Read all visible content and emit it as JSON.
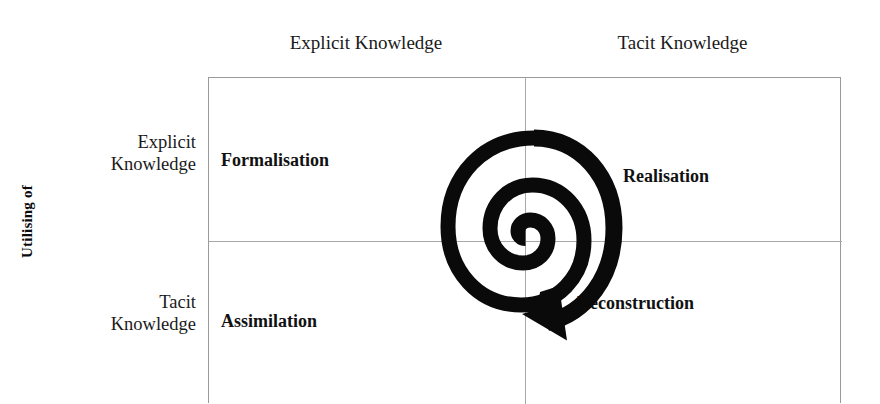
{
  "figure": {
    "type": "2x2-matrix-diagram",
    "columns_axis": {
      "labels": [
        "Explicit Knowledge",
        "Tacit Knowledge"
      ]
    },
    "rows_axis": {
      "title": "Utilising of",
      "labels": [
        {
          "line1": "Explicit",
          "line2": "Knowledge"
        },
        {
          "line1": "Tacit",
          "line2": "Knowledge"
        }
      ]
    },
    "quadrants": {
      "top_left": "Formalisation",
      "top_right": "Realisation",
      "bottom_left": "Assimilation",
      "bottom_right": "Deconstruction"
    },
    "center_graphic": {
      "name": "spiral-arrow",
      "color": "#000000",
      "direction": "outward-clockwise-with-arrowhead"
    },
    "colors": {
      "text": "#111111",
      "frame_line": "#9a9a9a",
      "divider_line": "#a8a8a8",
      "spiral": "#000000",
      "background": "#ffffff"
    }
  }
}
